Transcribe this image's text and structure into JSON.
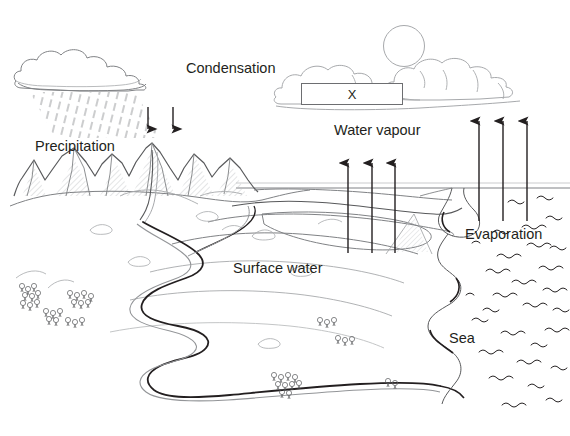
{
  "diagram": {
    "type": "labelled-line-drawing",
    "background_color": "#ffffff",
    "ink_color": "#231f20",
    "light_ink_color": "#808285",
    "mid_ink_color": "#58595b"
  },
  "labels": {
    "condensation": "Condensation",
    "precipitation": "Precipitation",
    "water_vapour": "Water vapour",
    "evaporation": "Evaporation",
    "surface_water": "Surface water",
    "sea": "Sea",
    "unknown_box": "X"
  },
  "features": {
    "sun": "sun-circle",
    "left_cloud": "rain-cloud",
    "right_clouds": "fair-weather-clouds",
    "rain": "rain-hatching",
    "mountains": "mountain-range",
    "river": "meandering-river",
    "sea_waves": "sea-wave-marks",
    "trees": "tree-clusters",
    "horizon": "horizon-line"
  },
  "arrows": {
    "precipitation_down": {
      "name": "precipitation-arrows",
      "direction": "down",
      "count": 2
    },
    "water_vapour_up": {
      "name": "water-vapour-arrows",
      "direction": "up",
      "count": 3
    },
    "evaporation_up": {
      "name": "evaporation-arrows",
      "direction": "up",
      "count": 3
    }
  }
}
